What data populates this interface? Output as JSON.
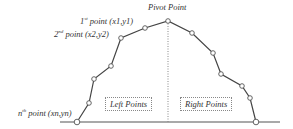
{
  "labels": {
    "pivot": "Pivot Point",
    "first_point": "1st point (x1,y1)",
    "second_point": "2nd point (x2,y2)",
    "nth_point": "nth point (xn,yn)",
    "left_points": "Left Points",
    "right_points": "Right Points"
  },
  "points": [
    [
      77,
      122
    ],
    [
      89,
      103
    ],
    [
      94,
      79
    ],
    [
      111,
      66
    ],
    [
      121,
      38
    ],
    [
      145,
      28
    ],
    [
      168,
      21
    ],
    [
      192,
      33
    ],
    [
      213,
      53
    ],
    [
      221,
      74
    ],
    [
      242,
      86
    ],
    [
      250,
      98
    ],
    [
      256,
      122
    ]
  ],
  "colors": {
    "line": "#444444",
    "marker": "#555555"
  }
}
